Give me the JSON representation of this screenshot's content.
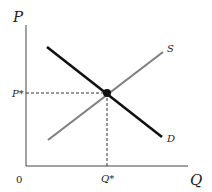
{
  "diagram": {
    "type": "supply-demand",
    "axes": {
      "y_label": "P",
      "x_label": "Q",
      "origin_label": "0"
    },
    "curves": [
      {
        "name": "S",
        "label": "S",
        "color": "#808080",
        "from": [
          48,
          140
        ],
        "to": [
          163,
          52
        ]
      },
      {
        "name": "D",
        "label": "D",
        "color": "#111111",
        "from": [
          47,
          47
        ],
        "to": [
          162,
          137
        ]
      }
    ],
    "equilibrium": {
      "price_label": "P*",
      "quantity_label": "Q*",
      "point": [
        107,
        93
      ]
    }
  }
}
